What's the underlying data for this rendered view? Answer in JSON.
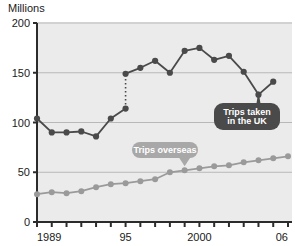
{
  "chart_data": {
    "type": "line",
    "title": "",
    "ylabel": "Millions",
    "xlabel": "",
    "ylim": [
      0,
      200
    ],
    "yticks": [
      0,
      50,
      100,
      150,
      200
    ],
    "ytick_labels": [
      "0",
      "50",
      "100",
      "150",
      "200"
    ],
    "grid": true,
    "grid_axis": "y",
    "legend_position": "inline-callouts",
    "x": [
      1989,
      1990,
      1991,
      1992,
      1993,
      1994,
      1995,
      1995,
      1996,
      1997,
      1998,
      1999,
      2000,
      2001,
      2002,
      2003,
      2004,
      2005,
      2006
    ],
    "xlim": [
      1989,
      2006
    ],
    "xticks": [
      1989,
      1990,
      1991,
      1992,
      1993,
      1994,
      1995,
      1996,
      1997,
      1998,
      1999,
      2000,
      2001,
      2002,
      2003,
      2004,
      2005,
      2006
    ],
    "xtick_labels_shown": [
      "1989",
      "95",
      "2000",
      "06"
    ],
    "xtick_labels_shown_at": [
      1989,
      1995,
      2000,
      2006
    ],
    "series": [
      {
        "name": "Trips taken in the UK",
        "color": "#4a4a4a",
        "marker": "circle",
        "has_break": true,
        "break_note": "dotted vertical discontinuity at 1995 between 114 and 149",
        "points": [
          {
            "x": 1989,
            "y": 104
          },
          {
            "x": 1990,
            "y": 90
          },
          {
            "x": 1991,
            "y": 90
          },
          {
            "x": 1992,
            "y": 91
          },
          {
            "x": 1993,
            "y": 86
          },
          {
            "x": 1994,
            "y": 104
          },
          {
            "x": 1995,
            "y": 114
          },
          {
            "x": 1995,
            "y": 149
          },
          {
            "x": 1996,
            "y": 155
          },
          {
            "x": 1997,
            "y": 162
          },
          {
            "x": 1998,
            "y": 150
          },
          {
            "x": 1999,
            "y": 172
          },
          {
            "x": 2000,
            "y": 175
          },
          {
            "x": 2001,
            "y": 163
          },
          {
            "x": 2002,
            "y": 167
          },
          {
            "x": 2003,
            "y": 151
          },
          {
            "x": 2004,
            "y": 128
          },
          {
            "x": 2005,
            "y": 141
          }
        ]
      },
      {
        "name": "Trips overseas",
        "color": "#9a9a9a",
        "marker": "circle",
        "has_break": false,
        "points": [
          {
            "x": 1989,
            "y": 28
          },
          {
            "x": 1990,
            "y": 30
          },
          {
            "x": 1991,
            "y": 29
          },
          {
            "x": 1992,
            "y": 31
          },
          {
            "x": 1993,
            "y": 35
          },
          {
            "x": 1994,
            "y": 38
          },
          {
            "x": 1995,
            "y": 39
          },
          {
            "x": 1996,
            "y": 41
          },
          {
            "x": 1997,
            "y": 43
          },
          {
            "x": 1998,
            "y": 50
          },
          {
            "x": 1999,
            "y": 52
          },
          {
            "x": 2000,
            "y": 54
          },
          {
            "x": 2001,
            "y": 56
          },
          {
            "x": 2002,
            "y": 57
          },
          {
            "x": 2003,
            "y": 60
          },
          {
            "x": 2004,
            "y": 62
          },
          {
            "x": 2005,
            "y": 64
          },
          {
            "x": 2006,
            "y": 66
          }
        ]
      }
    ],
    "annotations": [
      {
        "label": "Trips taken in the UK",
        "line1": "Trips taken",
        "line2": "in the UK",
        "style": "dark-callout",
        "fill": "#4a4a4a",
        "text_color": "#ffffff",
        "points_at_x": 2004,
        "points_at_y": 128
      },
      {
        "label": "Trips overseas",
        "line1": "Trips overseas",
        "line2": "",
        "style": "light-callout",
        "fill": "#a8a8a8",
        "text_color": "#ffffff",
        "points_at_x": 1999,
        "points_at_y": 52
      }
    ]
  },
  "axis": {
    "y_title": "Millions",
    "y_labels": [
      "200",
      "150",
      "100",
      "50",
      "0"
    ],
    "x_labels": [
      "1989",
      "95",
      "2000",
      "06"
    ]
  },
  "colors": {
    "background": "#ffffff",
    "plot_background": "#ebebeb",
    "grid": "#b8b8b8",
    "axis": "#2b2b2b",
    "series_uk": "#4a4a4a",
    "series_overseas": "#9a9a9a",
    "callout_dark": "#4a4a4a",
    "callout_light": "#a8a8a8",
    "text": "#1a1a1a"
  }
}
